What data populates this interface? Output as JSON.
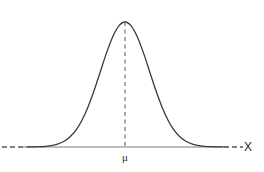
{
  "figure": {
    "title_partial_cropped": "",
    "background_color": "#ffffff",
    "curve_color": "#3a3a3a",
    "axis_color": "#a8a8a8",
    "dash_color": "#555555",
    "label_color": "#2b2b2b"
  },
  "labels": {
    "x_axis": "X",
    "mean": "μ"
  },
  "chart_data": {
    "type": "line",
    "title": "",
    "xlabel": "X",
    "ylabel": "",
    "grid": false,
    "legend": null,
    "annotations": [
      {
        "name": "mean-tick-label",
        "text": "μ",
        "x": 0.0,
        "y": 0.0
      },
      {
        "name": "x-axis-label",
        "text": "X",
        "x": 4.1,
        "y": 0.0
      },
      {
        "name": "mean-vertical-dashed-line",
        "text": "",
        "x": 0.0,
        "y": 1.0
      }
    ],
    "xlim": [
      -4.2,
      4.2
    ],
    "ylim": [
      0,
      1.08
    ],
    "distribution": "normal",
    "mean": 0,
    "sigma": 1,
    "peak_value": 1.0,
    "x": [
      -4.0,
      -3.75,
      -3.5,
      -3.25,
      -3.0,
      -2.75,
      -2.5,
      -2.25,
      -2.0,
      -1.75,
      -1.5,
      -1.25,
      -1.0,
      -0.75,
      -0.5,
      -0.25,
      0.0,
      0.25,
      0.5,
      0.75,
      1.0,
      1.25,
      1.5,
      1.75,
      2.0,
      2.25,
      2.5,
      2.75,
      3.0,
      3.25,
      3.5,
      3.75,
      4.0
    ],
    "values": [
      0.0003,
      0.0009,
      0.0022,
      0.0052,
      0.0111,
      0.0229,
      0.0439,
      0.0796,
      0.1353,
      0.2163,
      0.3247,
      0.4578,
      0.6065,
      0.7548,
      0.8825,
      0.9692,
      1.0,
      0.9692,
      0.8825,
      0.7548,
      0.6065,
      0.4578,
      0.3247,
      0.2163,
      0.1353,
      0.0796,
      0.0439,
      0.0229,
      0.0111,
      0.0052,
      0.0022,
      0.0009,
      0.0003
    ]
  }
}
